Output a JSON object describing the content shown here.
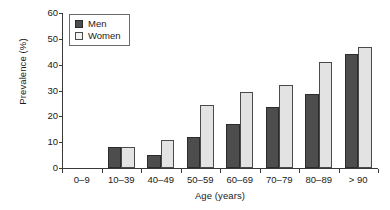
{
  "chart_data": {
    "type": "bar",
    "title": "",
    "xlabel": "Age (years)",
    "ylabel": "Prevalence (%)",
    "categories": [
      "0–9",
      "10–39",
      "40–49",
      "50–59",
      "60–69",
      "70–79",
      "80–89",
      "> 90"
    ],
    "series": [
      {
        "name": "Men",
        "color": "#4d4d4d",
        "values": [
          0,
          8,
          5,
          12,
          17,
          23.5,
          28.5,
          44
        ]
      },
      {
        "name": "Women",
        "color": "#e3e3e3",
        "values": [
          0,
          8,
          11,
          24.5,
          29.5,
          32,
          41,
          47
        ]
      }
    ],
    "ylim": [
      0,
      60
    ],
    "yticks": [
      0,
      10,
      20,
      30,
      40,
      50,
      60
    ],
    "ytick_labels": [
      "0",
      "10",
      "20",
      "30",
      "40",
      "50",
      "60"
    ],
    "grid": false,
    "legend_position": "top-left"
  },
  "legend": {
    "entries": [
      {
        "label": "Men"
      },
      {
        "label": "Women"
      }
    ]
  },
  "axes": {
    "y_title": "Prevalence (%)",
    "x_title": "Age (years)"
  }
}
